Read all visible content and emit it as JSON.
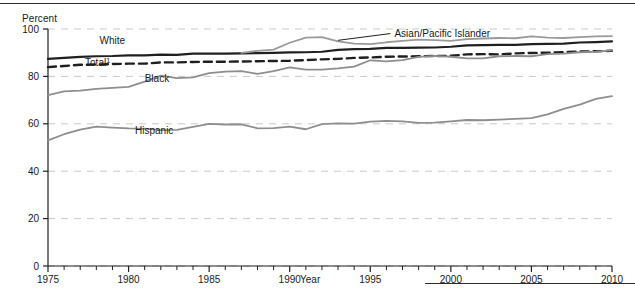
{
  "figure": {
    "ylabel": "Percent",
    "xlabel": "Year"
  },
  "chart_data": {
    "type": "line",
    "title": "",
    "subtitle": "",
    "xlabel": "Year",
    "ylabel": "Percent",
    "xlim": [
      1975,
      2010
    ],
    "ylim": [
      0,
      100
    ],
    "yticks": [
      0,
      20,
      40,
      60,
      80,
      100
    ],
    "xticks": [
      1975,
      1980,
      1985,
      1990,
      1995,
      2000,
      2005,
      2010
    ],
    "xtick_labels": [
      "1975",
      "1980",
      "1985",
      "1990",
      "1995",
      "2000",
      "2005",
      "2010"
    ],
    "ytick_labels": [
      "0",
      "20",
      "40",
      "60",
      "80",
      "100"
    ],
    "minor_xticks": "every 1 year",
    "grid": "horizontal dashed gridlines at every y tick",
    "legend": "inline labels placed next to each line",
    "annotations": [
      {
        "text": "Asian/Pacific Islander",
        "leader_line": true,
        "points_to_year": 1993
      }
    ],
    "footnote_marker": "1",
    "x": [
      1975,
      1976,
      1977,
      1978,
      1979,
      1980,
      1981,
      1982,
      1983,
      1984,
      1985,
      1986,
      1987,
      1988,
      1989,
      1990,
      1991,
      1992,
      1993,
      1994,
      1995,
      1996,
      1997,
      1998,
      1999,
      2000,
      2001,
      2002,
      2003,
      2004,
      2005,
      2006,
      2007,
      2008,
      2009,
      2010
    ],
    "series": [
      {
        "name": "White",
        "label": "White",
        "color": "#1f1f1f",
        "style": "solid",
        "width": 2.2,
        "label_x": 1978.2,
        "label_y": 93.5,
        "values": [
          87.4,
          87.8,
          88.2,
          88.5,
          88.6,
          88.9,
          88.9,
          89.2,
          89.1,
          89.6,
          89.6,
          89.6,
          89.7,
          89.8,
          89.9,
          90.1,
          90.2,
          90.4,
          91.2,
          91.5,
          91.6,
          92.0,
          92.0,
          92.1,
          92.2,
          92.5,
          93.1,
          93.2,
          93.3,
          93.3,
          93.6,
          93.7,
          93.8,
          94.3,
          94.5,
          94.8
        ],
        "right_end_approx": 95
      },
      {
        "name": "Total",
        "label": "Total",
        "color": "#1f1f1f",
        "style": "dashed",
        "width": 2.4,
        "label_x": 1977.3,
        "label_y": 84.3,
        "values": [
          83.9,
          84.4,
          84.9,
          85.0,
          85.2,
          85.4,
          85.4,
          85.9,
          85.9,
          86.1,
          86.2,
          86.2,
          86.3,
          86.4,
          86.5,
          86.6,
          86.9,
          87.2,
          87.4,
          87.8,
          88.0,
          88.3,
          88.4,
          88.5,
          88.6,
          88.7,
          89.3,
          89.4,
          89.3,
          89.7,
          89.9,
          90.0,
          90.2,
          90.5,
          90.6,
          90.8
        ],
        "right_end_approx": 91
      },
      {
        "name": "Asian/Pacific Islander",
        "label": "Asian/Pacific Islander",
        "color": "#9a9a9a",
        "style": "solid",
        "width": 1.8,
        "label_x": 1996.5,
        "label_y": 98.5,
        "values": [
          null,
          null,
          null,
          null,
          null,
          null,
          null,
          null,
          null,
          null,
          null,
          null,
          89.9,
          90.8,
          91.3,
          94.2,
          96.4,
          96.6,
          94.8,
          93.8,
          93.6,
          94.4,
          95.0,
          95.5,
          95.3,
          95.0,
          95.7,
          96.0,
          96.2,
          96.1,
          96.9,
          96.4,
          96.2,
          96.6,
          96.9,
          97.0
        ],
        "right_end_approx": 97
      },
      {
        "name": "Black",
        "label": "Black",
        "color": "#8e8e8e",
        "style": "solid",
        "width": 1.8,
        "label_x": 1981.0,
        "label_y": 77.5,
        "values": [
          72.1,
          73.7,
          74.0,
          74.7,
          75.2,
          75.6,
          77.8,
          80.3,
          79.3,
          79.6,
          81.4,
          82.0,
          82.2,
          81.1,
          82.2,
          83.8,
          82.9,
          82.9,
          83.4,
          84.1,
          86.8,
          86.3,
          86.9,
          88.2,
          88.7,
          88.3,
          87.6,
          87.6,
          88.5,
          88.6,
          88.5,
          89.4,
          89.6,
          90.2,
          90.4,
          91.0
        ],
        "right_end_approx": 91
      },
      {
        "name": "Hispanic",
        "label": "Hispanic",
        "color": "#8e8e8e",
        "style": "solid",
        "width": 1.8,
        "label_x": 1980.4,
        "label_y": 55.5,
        "values": [
          53.0,
          55.6,
          57.5,
          58.8,
          58.4,
          58.1,
          58.0,
          57.3,
          57.4,
          58.7,
          60.0,
          59.7,
          59.8,
          58.1,
          58.2,
          58.8,
          57.7,
          59.9,
          60.2,
          60.1,
          60.9,
          61.2,
          61.0,
          60.4,
          60.5,
          61.0,
          61.6,
          61.5,
          61.8,
          62.1,
          62.4,
          64.0,
          66.3,
          68.1,
          70.5,
          71.7
        ],
        "right_end_approx": 72
      }
    ]
  }
}
